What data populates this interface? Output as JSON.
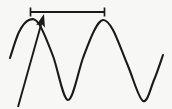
{
  "figure": {
    "background_color": "#f7f7f6",
    "stroke_color": "#1a1a1a",
    "width": 172,
    "height": 109
  },
  "chart_data": {
    "type": "line",
    "title": "",
    "xlabel": "",
    "ylabel": "",
    "grid": false,
    "legend": null,
    "xlim": [
      0,
      172
    ],
    "ylim": [
      109,
      0
    ],
    "series": [
      {
        "name": "waveform",
        "description": "continuous sinusoid, two full crests visible",
        "x": [
          10,
          19,
          29,
          39,
          53,
          68,
          83,
          94,
          103,
          113,
          128,
          143,
          154,
          163
        ],
        "y": [
          58,
          32,
          20,
          24,
          56,
          100,
          58,
          31,
          20,
          30,
          66,
          101,
          80,
          55
        ]
      }
    ],
    "annotations": [
      {
        "name": "wavelength-bar",
        "type": "dimension-bar",
        "x_start": 30,
        "x_end": 105,
        "y": 12,
        "tick_height": 9,
        "label": ""
      },
      {
        "name": "pointer-arrow",
        "type": "arrow",
        "tail_x": 18,
        "tail_y": 107,
        "head_x": 44,
        "head_y": 14,
        "label": ""
      }
    ]
  }
}
